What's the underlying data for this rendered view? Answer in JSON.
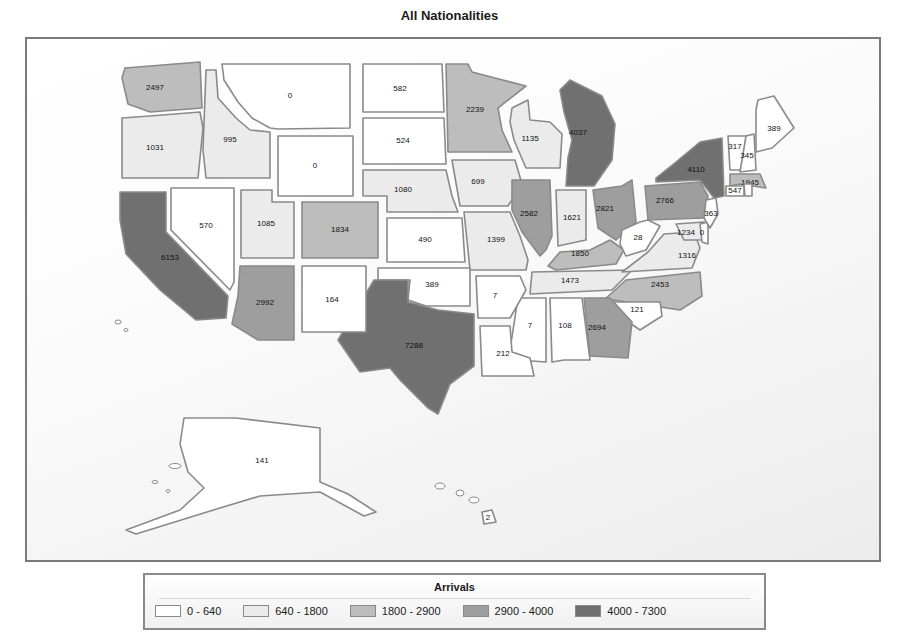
{
  "chart_data": {
    "type": "choropleth",
    "title": "All Nationalities",
    "legend": {
      "title": "Arrivals",
      "position": "bottom",
      "bins": [
        {
          "label": "0 - 640",
          "min": 0,
          "max": 640,
          "color": "#ffffff"
        },
        {
          "label": "640 - 1800",
          "min": 640,
          "max": 1800,
          "color": "#ebebeb"
        },
        {
          "label": "1800 - 2900",
          "min": 1800,
          "max": 2900,
          "color": "#bdbdbd"
        },
        {
          "label": "2900 - 4000",
          "min": 2900,
          "max": 4000,
          "color": "#9e9e9e"
        },
        {
          "label": "4000 - 7300",
          "min": 4000,
          "max": 7300,
          "color": "#707070"
        }
      ]
    },
    "states": [
      {
        "state": "WA",
        "value": 2497,
        "bin": 2,
        "lx": 155,
        "ly": 88,
        "pts": "125,68 200,62 202,108 150,112 128,104 122,78"
      },
      {
        "state": "OR",
        "value": 1031,
        "bin": 1,
        "lx": 155,
        "ly": 148,
        "pts": "122,118 150,116 200,112 203,128 198,178 122,178"
      },
      {
        "state": "ID",
        "value": 995,
        "bin": 1,
        "lx": 230,
        "ly": 140,
        "pts": "206,70 216,70 218,98 236,118 250,130 270,132 270,178 206,178 203,150"
      },
      {
        "state": "MT",
        "value": 0,
        "bin": 0,
        "lx": 290,
        "ly": 96,
        "pts": "222,64 350,64 350,128 278,129 270,128 252,118 238,102 224,80"
      },
      {
        "state": "WY",
        "value": 0,
        "bin": 0,
        "lx": 315,
        "ly": 166,
        "pts": "278,136 353,136 353,196 278,196"
      },
      {
        "state": "ND",
        "value": 582,
        "bin": 0,
        "lx": 400,
        "ly": 89,
        "pts": "363,64 442,64 444,112 363,112"
      },
      {
        "state": "SD",
        "value": 524,
        "bin": 0,
        "lx": 403,
        "ly": 141,
        "pts": "363,118 444,118 446,164 363,164"
      },
      {
        "state": "NE",
        "value": 1080,
        "bin": 1,
        "lx": 403,
        "ly": 190,
        "pts": "363,170 446,170 452,196 458,212 387,212 387,196 363,196"
      },
      {
        "state": "KS",
        "value": 490,
        "bin": 0,
        "lx": 425,
        "ly": 240,
        "pts": "387,218 462,218 465,262 387,262"
      },
      {
        "state": "MN",
        "value": 2239,
        "bin": 2,
        "lx": 475,
        "ly": 110,
        "pts": "446,64 468,64 472,72 495,78 526,86 498,108 502,130 512,152 448,152"
      },
      {
        "state": "IA",
        "value": 699,
        "bin": 1,
        "lx": 478,
        "ly": 182,
        "pts": "452,160 515,160 522,184 508,206 460,206"
      },
      {
        "state": "MO",
        "value": 1399,
        "bin": 1,
        "lx": 496,
        "ly": 240,
        "pts": "464,212 510,212 520,236 528,260 526,270 470,270 468,250"
      },
      {
        "state": "WI",
        "value": 1135,
        "bin": 1,
        "lx": 530,
        "ly": 139,
        "pts": "512,108 528,100 530,120 550,122 562,134 560,168 526,168 514,140 510,122"
      },
      {
        "state": "MI",
        "value": 4037,
        "bin": 4,
        "lx": 578,
        "ly": 133,
        "pts": "560,90 570,80 602,96 615,124 612,160 594,186 566,186 568,158 572,140 564,112"
      },
      {
        "state": "IL",
        "value": 2582,
        "bin": 3,
        "lx": 529,
        "ly": 214,
        "pts": "512,180 550,180 552,236 546,250 540,256 522,232 512,210"
      },
      {
        "state": "IN",
        "value": 1621,
        "bin": 1,
        "lx": 572,
        "ly": 218,
        "pts": "556,190 586,190 586,240 558,246"
      },
      {
        "state": "OH",
        "value": 2821,
        "bin": 3,
        "lx": 605,
        "ly": 209,
        "pts": "593,190 622,186 632,180 636,222 616,240 598,228"
      },
      {
        "state": "KY",
        "value": 1850,
        "bin": 2,
        "lx": 580,
        "ly": 254,
        "pts": "548,266 560,252 590,250 610,240 624,250 616,264 556,270"
      },
      {
        "state": "TN",
        "value": 1473,
        "bin": 1,
        "lx": 570,
        "ly": 281,
        "pts": "532,272 632,270 612,290 530,294"
      },
      {
        "state": "PA",
        "value": 2766,
        "bin": 3,
        "lx": 665,
        "ly": 201,
        "pts": "645,186 700,182 708,196 704,218 648,220"
      },
      {
        "state": "NY",
        "value": 4110,
        "bin": 4,
        "lx": 696,
        "ly": 170,
        "pts": "656,178 676,162 700,142 722,138 724,196 714,198 700,180 656,182"
      },
      {
        "state": "WV",
        "value": 28,
        "bin": 0,
        "lx": 638,
        "ly": 238,
        "pts": "622,230 640,222 648,220 660,226 646,250 626,256 620,244"
      },
      {
        "state": "VA",
        "value": 1316,
        "bin": 1,
        "lx": 687,
        "ly": 256,
        "pts": "630,266 648,252 664,234 694,232 700,248 692,268 622,272"
      },
      {
        "state": "MD",
        "value": 1234,
        "bin": 1,
        "lx": 686,
        "ly": 233,
        "pts": "676,224 704,222 706,240 684,240"
      },
      {
        "state": "DE",
        "value": 0,
        "bin": 0,
        "lx": 702,
        "ly": 233,
        "pts": "700,224 708,222 708,244 702,242"
      },
      {
        "state": "NJ",
        "value": 363,
        "bin": 0,
        "lx": 711,
        "ly": 214,
        "pts": "706,200 716,198 718,214 710,228 704,218"
      },
      {
        "state": "NC",
        "value": 2453,
        "bin": 2,
        "lx": 660,
        "ly": 285,
        "pts": "604,300 626,280 700,272 702,296 680,310 614,300"
      },
      {
        "state": "SC",
        "value": 121,
        "bin": 0,
        "lx": 637,
        "ly": 310,
        "pts": "614,302 660,302 662,316 640,330 620,316"
      },
      {
        "state": "GA",
        "value": 2694,
        "bin": 3,
        "lx": 597,
        "ly": 328,
        "pts": "584,298 610,298 632,322 628,358 590,356"
      },
      {
        "state": "AL",
        "value": 108,
        "bin": 0,
        "lx": 565,
        "ly": 326,
        "pts": "550,298 582,298 590,360 564,360 552,362"
      },
      {
        "state": "MS",
        "value": 7,
        "bin": 0,
        "lx": 530,
        "ly": 326,
        "pts": "518,298 546,298 546,362 518,360 510,350"
      },
      {
        "state": "LA",
        "value": 212,
        "bin": 0,
        "lx": 503,
        "ly": 354,
        "pts": "480,326 510,326 512,352 530,358 534,376 482,376"
      },
      {
        "state": "AR",
        "value": 7,
        "bin": 0,
        "lx": 495,
        "ly": 296,
        "pts": "476,276 520,276 526,290 510,318 478,318"
      },
      {
        "state": "OK",
        "value": 389,
        "bin": 0,
        "lx": 432,
        "ly": 285,
        "pts": "378,268 470,268 470,306 426,306 408,300 410,280 378,280"
      },
      {
        "state": "TX",
        "value": 7288,
        "bin": 4,
        "lx": 414,
        "ly": 346,
        "pts": "374,280 408,280 408,302 438,310 474,314 474,366 450,384 438,414 428,408 400,380 390,368 360,372 338,340"
      },
      {
        "state": "NM",
        "value": 164,
        "bin": 0,
        "lx": 332,
        "ly": 300,
        "pts": "302,266 366,266 366,332 302,332"
      },
      {
        "state": "AZ",
        "value": 2992,
        "bin": 3,
        "lx": 265,
        "ly": 303,
        "pts": "240,266 294,266 294,340 258,340 232,324 238,296"
      },
      {
        "state": "UT",
        "value": 1085,
        "bin": 1,
        "lx": 266,
        "ly": 224,
        "pts": "241,190 272,190 272,202 294,202 294,258 241,258"
      },
      {
        "state": "CO",
        "value": 1834,
        "bin": 2,
        "lx": 340,
        "ly": 230,
        "pts": "302,202 378,202 378,258 302,258"
      },
      {
        "state": "NV",
        "value": 570,
        "bin": 0,
        "lx": 206,
        "ly": 226,
        "pts": "171,188 234,188 234,282 230,290 171,230"
      },
      {
        "state": "CA",
        "value": 6153,
        "bin": 4,
        "lx": 170,
        "ly": 258,
        "pts": "120,192 166,192 166,232 228,296 226,318 196,320 160,290 126,254 120,220"
      },
      {
        "state": "VT",
        "value": 317,
        "bin": 0,
        "lx": 735,
        "ly": 147,
        "pts": "728,136 746,136 744,170 730,170"
      },
      {
        "state": "NH",
        "value": 345,
        "bin": 0,
        "lx": 747,
        "ly": 156,
        "pts": "746,136 754,134 756,170 740,172"
      },
      {
        "state": "ME",
        "value": 389,
        "bin": 0,
        "lx": 774,
        "ly": 129,
        "pts": "758,100 774,96 794,128 772,148 756,152 756,110"
      },
      {
        "state": "MA",
        "value": 1945,
        "bin": 2,
        "lx": 750,
        "ly": 183,
        "pts": "730,174 760,174 766,188 740,184 730,186"
      },
      {
        "state": "CT",
        "value": 547,
        "bin": 0,
        "lx": 735,
        "ly": 191,
        "pts": "726,186 744,186 744,196 726,196"
      },
      {
        "state": "RI",
        "value": null,
        "bin": 0,
        "lx": 748,
        "ly": 190,
        "pts": "744,184 752,184 752,196 745,196"
      },
      {
        "state": "AK",
        "value": 141,
        "bin": 0,
        "lx": 262,
        "ly": 461,
        "pts": "184,418 236,418 320,428 320,482 348,494 376,512 364,516 320,492 260,496 220,508 136,534 126,530 180,510 204,488 188,472 180,444"
      },
      {
        "state": "HI",
        "value": 2,
        "bin": 0,
        "lx": 488,
        "ly": 518,
        "pts": "482,512 492,510 496,522 484,524"
      }
    ]
  },
  "title": "All Nationalities",
  "legend": {
    "title": "Arrivals",
    "items": [
      "0 - 640",
      "640 - 1800",
      "1800 - 2900",
      "2900 - 4000",
      "4000 - 7300"
    ]
  }
}
